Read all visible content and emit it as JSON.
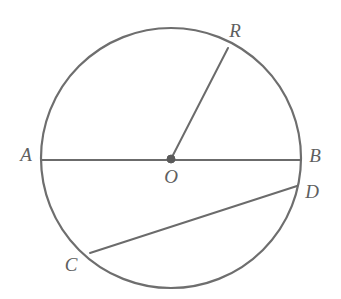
{
  "figure": {
    "background_color": "#ffffff",
    "stroke_color": "#6b6b6b",
    "label_color": "#5f5f5f"
  },
  "circle": {
    "name": "circle-O",
    "center_x": 171,
    "center_y": 158,
    "radius": 130
  },
  "center_point": {
    "label": "O",
    "x": 171,
    "y": 159,
    "label_x": 171,
    "label_y": 179
  },
  "points": {
    "A": {
      "label": "A",
      "x": 41,
      "y": 160,
      "label_x": 26,
      "label_y": 157
    },
    "B": {
      "label": "B",
      "x": 301,
      "y": 160,
      "label_x": 315,
      "label_y": 158
    },
    "R": {
      "label": "R",
      "x": 228,
      "y": 48,
      "label_x": 235,
      "label_y": 33
    },
    "C": {
      "label": "C",
      "x": 90,
      "y": 253,
      "label_x": 71,
      "label_y": 267
    },
    "D": {
      "label": "D",
      "x": 297,
      "y": 186,
      "label_x": 312,
      "label_y": 194
    }
  },
  "segments": [
    {
      "name": "diameter-AB",
      "from": "A",
      "to": "B",
      "x1": 41,
      "y1": 160,
      "x2": 301,
      "y2": 160
    },
    {
      "name": "radius-OR",
      "from": "O",
      "to": "R",
      "x1": 171,
      "y1": 159,
      "x2": 228,
      "y2": 48
    },
    {
      "name": "chord-CD",
      "from": "C",
      "to": "D",
      "x1": 90,
      "y1": 253,
      "x2": 297,
      "y2": 186
    }
  ]
}
